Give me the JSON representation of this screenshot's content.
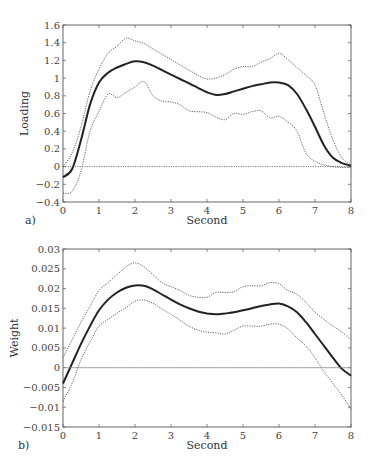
{
  "chart_data": [
    {
      "panel": "a)",
      "type": "line",
      "title": "",
      "xlabel": "Second",
      "ylabel": "Loading",
      "xlim": [
        0,
        8
      ],
      "ylim": [
        -0.4,
        1.6
      ],
      "xticks": [
        "0",
        "1",
        "2",
        "3",
        "4",
        "5",
        "6",
        "7",
        "8"
      ],
      "yticks": [
        "-0.4",
        "-0.2",
        "0",
        "0.2",
        "0.4",
        "0.6",
        "0.8",
        "1",
        "1.2",
        "1.4",
        "1.6"
      ],
      "grid": false,
      "x": [
        0,
        0.25,
        0.5,
        0.75,
        1,
        1.25,
        1.5,
        1.75,
        2,
        2.25,
        2.5,
        2.75,
        3,
        3.25,
        3.5,
        3.75,
        4,
        4.25,
        4.5,
        4.75,
        5,
        5.25,
        5.5,
        5.75,
        6,
        6.25,
        6.5,
        6.75,
        7,
        7.25,
        7.5,
        7.75,
        8
      ],
      "series": [
        {
          "name": "mean",
          "style": "solid-thick",
          "values": [
            -0.12,
            -0.03,
            0.3,
            0.7,
            0.95,
            1.06,
            1.12,
            1.16,
            1.19,
            1.18,
            1.14,
            1.09,
            1.04,
            0.99,
            0.94,
            0.89,
            0.84,
            0.81,
            0.82,
            0.85,
            0.88,
            0.91,
            0.93,
            0.95,
            0.95,
            0.92,
            0.82,
            0.65,
            0.45,
            0.24,
            0.1,
            0.04,
            0.01
          ]
        },
        {
          "name": "upper bound",
          "style": "dotted",
          "values": [
            0.0,
            0.15,
            0.45,
            0.85,
            1.1,
            1.28,
            1.36,
            1.45,
            1.42,
            1.39,
            1.33,
            1.27,
            1.21,
            1.15,
            1.09,
            1.03,
            0.99,
            1.0,
            1.04,
            1.1,
            1.13,
            1.13,
            1.18,
            1.22,
            1.28,
            1.21,
            1.12,
            1.03,
            0.92,
            0.6,
            0.3,
            0.1,
            0.02
          ]
        },
        {
          "name": "lower bound",
          "style": "dotted",
          "values": [
            -0.3,
            -0.28,
            -0.05,
            0.4,
            0.62,
            0.82,
            0.78,
            0.84,
            0.9,
            0.96,
            0.8,
            0.74,
            0.73,
            0.7,
            0.63,
            0.62,
            0.61,
            0.56,
            0.53,
            0.6,
            0.59,
            0.62,
            0.63,
            0.55,
            0.57,
            0.5,
            0.4,
            0.15,
            0.06,
            0.02,
            0.0,
            -0.01,
            -0.01
          ]
        },
        {
          "name": "zero line",
          "style": "dotted-thin",
          "values": [
            0,
            0
          ]
        }
      ]
    },
    {
      "panel": "b)",
      "type": "line",
      "title": "",
      "xlabel": "Second",
      "ylabel": "Weight",
      "xlim": [
        0,
        8
      ],
      "ylim": [
        -0.015,
        0.03
      ],
      "xticks": [
        "0",
        "1",
        "2",
        "3",
        "4",
        "5",
        "6",
        "7",
        "8"
      ],
      "yticks": [
        "-0.015",
        "-0.01",
        "-0.005",
        "0",
        "0.005",
        "0.01",
        "0.015",
        "0.02",
        "0.025",
        "0.03"
      ],
      "grid": false,
      "x": [
        0,
        0.25,
        0.5,
        0.75,
        1,
        1.25,
        1.5,
        1.75,
        2,
        2.25,
        2.5,
        2.75,
        3,
        3.25,
        3.5,
        3.75,
        4,
        4.25,
        4.5,
        4.75,
        5,
        5.25,
        5.5,
        5.75,
        6,
        6.25,
        6.5,
        6.75,
        7,
        7.25,
        7.5,
        7.75,
        8
      ],
      "series": [
        {
          "name": "mean",
          "style": "solid-thick",
          "values": [
            -0.004,
            0.001,
            0.006,
            0.0105,
            0.0145,
            0.0172,
            0.019,
            0.0202,
            0.0208,
            0.0207,
            0.0198,
            0.0185,
            0.0172,
            0.016,
            0.015,
            0.0142,
            0.0137,
            0.0135,
            0.0137,
            0.014,
            0.0145,
            0.015,
            0.0156,
            0.016,
            0.0162,
            0.0155,
            0.014,
            0.0115,
            0.0085,
            0.0055,
            0.0025,
            -0.0003,
            -0.002
          ]
        },
        {
          "name": "upper bound",
          "style": "dotted",
          "values": [
            0.0025,
            0.007,
            0.0115,
            0.0155,
            0.0195,
            0.0215,
            0.0235,
            0.0255,
            0.0265,
            0.0255,
            0.0235,
            0.0215,
            0.0205,
            0.0195,
            0.0183,
            0.0178,
            0.0178,
            0.019,
            0.019,
            0.0192,
            0.0205,
            0.0207,
            0.0207,
            0.0215,
            0.0212,
            0.0195,
            0.0185,
            0.0165,
            0.014,
            0.0122,
            0.0105,
            0.009,
            0.007
          ]
        },
        {
          "name": "lower bound",
          "style": "dotted",
          "values": [
            -0.0085,
            -0.004,
            0.002,
            0.0065,
            0.0105,
            0.0122,
            0.0138,
            0.0152,
            0.0168,
            0.0171,
            0.0163,
            0.0148,
            0.0135,
            0.012,
            0.0105,
            0.0095,
            0.009,
            0.0088,
            0.0085,
            0.0095,
            0.0105,
            0.0105,
            0.0105,
            0.011,
            0.011,
            0.0098,
            0.0075,
            0.0055,
            0.0025,
            -0.001,
            -0.004,
            -0.007,
            -0.0105
          ]
        },
        {
          "name": "zero line",
          "style": "solid-thin",
          "values": [
            0,
            0
          ]
        }
      ]
    }
  ]
}
